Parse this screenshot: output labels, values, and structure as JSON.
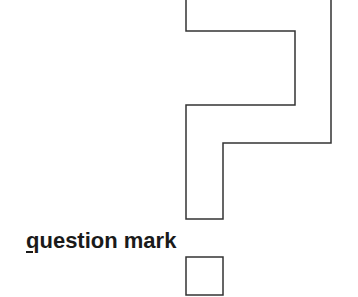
{
  "figure": {
    "label": {
      "mnemonic": "q",
      "rest": "uestion mark",
      "full": "question mark"
    },
    "glyph": "question-mark-outline",
    "stroke_color": "#333333",
    "background_color": "#ffffff",
    "outline_path": [
      [
        186,
        0
      ],
      [
        186,
        31
      ],
      [
        295,
        31
      ],
      [
        295,
        105
      ],
      [
        186,
        105
      ],
      [
        186,
        219
      ],
      [
        223,
        219
      ],
      [
        223,
        143
      ],
      [
        331,
        143
      ],
      [
        331,
        0
      ]
    ],
    "dot_box": {
      "x": 186,
      "y": 257,
      "width": 37,
      "height": 38
    }
  }
}
